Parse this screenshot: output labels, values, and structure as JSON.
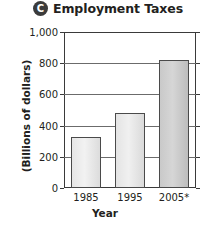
{
  "figure": {
    "badge_letter": "C",
    "title": "Employment Taxes"
  },
  "chart_data": {
    "type": "bar",
    "title": "Employment Taxes",
    "xlabel": "Year",
    "ylabel": "(Billions of dollars)",
    "categories": [
      "1985",
      "1995",
      "2005*"
    ],
    "values": [
      330,
      480,
      820
    ],
    "ylim": [
      0,
      1000
    ],
    "yticks": [
      0,
      200,
      400,
      600,
      800,
      1000
    ],
    "ytick_labels": [
      "0",
      "200",
      "400",
      "600",
      "800",
      "1,000"
    ],
    "grid": true,
    "legend": "none",
    "colors": {
      "bar_fill_light": "#eeeeee",
      "bar_fill_dark": "#cccccc",
      "bar_border": "#4a4a4a",
      "frame": "#3a3a3a",
      "gridline": "#6b6b6b",
      "badge": "#3b3b3b",
      "text": "#231f20"
    }
  }
}
